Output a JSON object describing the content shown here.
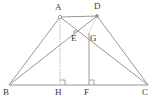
{
  "figure": {
    "type": "geometry-diagram",
    "width": 159,
    "height": 106,
    "background_color": "#ffffff",
    "stroke_color": "#8c8c8c",
    "label_color": "#3a3a3a",
    "dashed_stroke_color": "#a8a8a8",
    "stroke_width": 0.8
  },
  "points": [
    {
      "name": "A",
      "x": 60,
      "y": 17,
      "label": "A",
      "label_x": 55,
      "label_y": 3,
      "marker": true
    },
    {
      "name": "D",
      "x": 97,
      "y": 16,
      "label": "D",
      "label_x": 94,
      "label_y": 2,
      "marker": true
    },
    {
      "name": "B",
      "x": 9,
      "y": 85,
      "label": "B",
      "label_x": 3,
      "label_y": 88,
      "marker": false
    },
    {
      "name": "C",
      "x": 148,
      "y": 85,
      "label": "C",
      "label_x": 142,
      "label_y": 88,
      "marker": false
    },
    {
      "name": "E",
      "x": 75,
      "y": 32,
      "label": "E",
      "label_x": 71,
      "label_y": 34,
      "marker": true
    },
    {
      "name": "G",
      "x": 89,
      "y": 33,
      "label": "G",
      "label_x": 90,
      "label_y": 34,
      "marker": false
    },
    {
      "name": "H",
      "x": 60,
      "y": 85,
      "label": "H",
      "label_x": 55,
      "label_y": 88,
      "marker": false
    },
    {
      "name": "F",
      "x": 89,
      "y": 85,
      "label": "F",
      "label_x": 84,
      "label_y": 88,
      "marker": false
    }
  ],
  "segments": [
    {
      "name": "AD-top-side",
      "from": "A",
      "to": "D",
      "style": "solid"
    },
    {
      "name": "BC-base",
      "from": "B",
      "to": "C",
      "style": "solid"
    },
    {
      "name": "AB-left-leg",
      "from": "A",
      "to": "B",
      "style": "solid"
    },
    {
      "name": "DC-right-leg",
      "from": "D",
      "to": "C",
      "style": "solid"
    },
    {
      "name": "AC-diagonal",
      "from": "A",
      "to": "C",
      "style": "solid"
    },
    {
      "name": "BD-diagonal",
      "from": "B",
      "to": "D",
      "style": "solid"
    },
    {
      "name": "AH-altitude",
      "from": "A",
      "to": "H",
      "style": "dashed"
    },
    {
      "name": "GF-altitude",
      "from": "G",
      "to": "F",
      "style": "solid"
    },
    {
      "name": "DG-segment",
      "from": "D",
      "to": "G",
      "style": "dashed"
    }
  ],
  "right_angle_marks": [
    {
      "name": "right-angle-at-H",
      "x": 60,
      "y": 85,
      "size": 5,
      "direction": "up-right"
    },
    {
      "name": "right-angle-at-F",
      "x": 89,
      "y": 85,
      "size": 5,
      "direction": "up-right"
    }
  ]
}
